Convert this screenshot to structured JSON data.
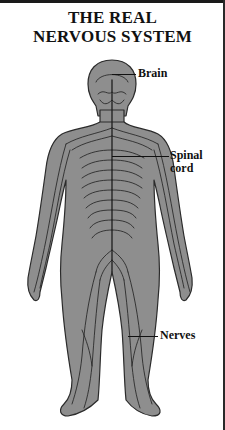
{
  "title": {
    "line1": "THE REAL",
    "line2": "NERVOUS SYSTEM"
  },
  "labels": {
    "brain": "Brain",
    "spinal_cord_line1": "Spinal",
    "spinal_cord_line2": "cord",
    "nerves": "Nerves"
  },
  "colors": {
    "body_fill": "#8c8c8c",
    "outline": "#2b2b2b",
    "nerve": "#1e1e1e",
    "background": "#ffffff"
  }
}
